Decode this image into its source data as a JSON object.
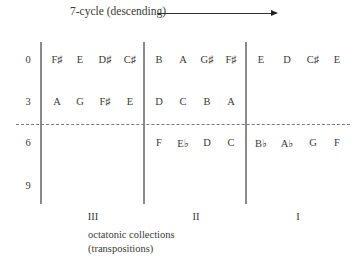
{
  "diagram": {
    "title": "7-cycle (descending)",
    "arrow_direction": "right",
    "row_labels": [
      "0",
      "3",
      "6",
      "9"
    ],
    "column_labels": [
      "III",
      "II",
      "I"
    ],
    "caption_line1": "octatonic collections",
    "caption_line2": "(transpositions)",
    "cells": {
      "row0": {
        "III": [
          "F♯",
          "E",
          "D♯",
          "C♯"
        ],
        "II": [
          "B",
          "A",
          "G♯",
          "F♯"
        ],
        "I": [
          "E",
          "D",
          "C♯",
          "E"
        ]
      },
      "row3": {
        "III": [
          "A",
          "G",
          "F♯",
          "E"
        ],
        "II": [
          "D",
          "C",
          "B",
          "A"
        ],
        "I": []
      },
      "row6": {
        "III": [],
        "II": [
          "F",
          "E♭",
          "D",
          "C"
        ],
        "I": [
          "B♭",
          "A♭",
          "G",
          "F"
        ]
      },
      "row9": {
        "III": [],
        "II": [],
        "I": []
      }
    },
    "colors": {
      "text": "#3a3a3a",
      "lines": "#8a8a8a"
    }
  }
}
